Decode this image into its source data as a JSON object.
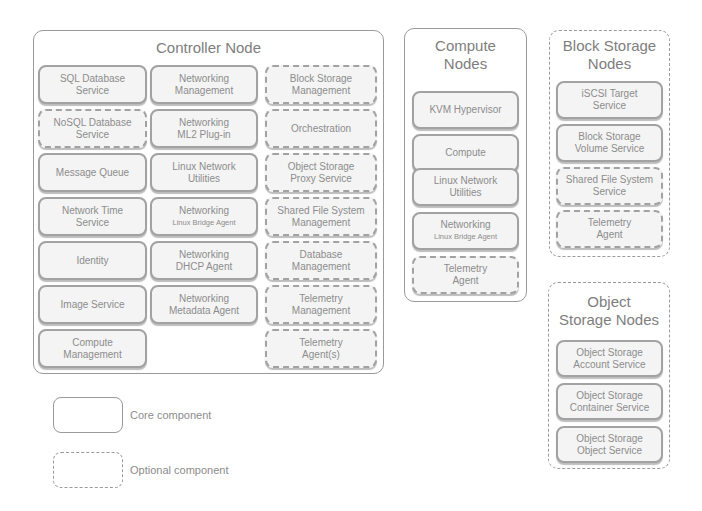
{
  "diagram": {
    "controller": {
      "title": "Controller Node",
      "style": "core",
      "columns": [
        [
          {
            "l1": "SQL Database",
            "l2": "Service",
            "style": "core"
          },
          {
            "l1": "NoSQL Database",
            "l2": "Service",
            "style": "optional"
          },
          {
            "l1": "Message Queue",
            "l2": "",
            "style": "core"
          },
          {
            "l1": "Network Time",
            "l2": "Service",
            "style": "core"
          },
          {
            "l1": "Identity",
            "l2": "",
            "style": "core"
          },
          {
            "l1": "Image Service",
            "l2": "",
            "style": "core"
          },
          {
            "l1": "Compute",
            "l2": "Management",
            "style": "core"
          }
        ],
        [
          {
            "l1": "Networking",
            "l2": "Management",
            "style": "core"
          },
          {
            "l1": "Networking",
            "l2": "ML2 Plug-in",
            "style": "core"
          },
          {
            "l1": "Linux Network",
            "l2": "Utilities",
            "style": "core"
          },
          {
            "l1": "Networking",
            "l2": "Linux Bridge Agent",
            "style": "core",
            "small2": true
          },
          {
            "l1": "Networking",
            "l2": "DHCP Agent",
            "style": "core"
          },
          {
            "l1": "Networking",
            "l2": "Metadata Agent",
            "style": "core"
          }
        ],
        [
          {
            "l1": "Block Storage",
            "l2": "Management",
            "style": "optional"
          },
          {
            "l1": "Orchestration",
            "l2": "",
            "style": "optional"
          },
          {
            "l1": "Object Storage",
            "l2": "Proxy Service",
            "style": "optional"
          },
          {
            "l1": "Shared File System",
            "l2": "Management",
            "style": "optional"
          },
          {
            "l1": "Database",
            "l2": "Management",
            "style": "optional"
          },
          {
            "l1": "Telemetry",
            "l2": "Management",
            "style": "optional"
          },
          {
            "l1": "Telemetry",
            "l2": "Agent(s)",
            "style": "optional"
          }
        ]
      ]
    },
    "compute": {
      "title_l1": "Compute",
      "title_l2": "Nodes",
      "style": "core",
      "items": [
        {
          "l1": "KVM Hypervisor",
          "l2": "",
          "style": "core"
        },
        {
          "l1": "Compute",
          "l2": "",
          "style": "core"
        },
        {
          "l1": "Linux Network",
          "l2": "Utilities",
          "style": "core"
        },
        {
          "l1": "Networking",
          "l2": "Linux Bridge Agent",
          "style": "core",
          "small2": true
        },
        {
          "l1": "Telemetry",
          "l2": "Agent",
          "style": "optional"
        }
      ]
    },
    "block_storage": {
      "title_l1": "Block Storage",
      "title_l2": "Nodes",
      "style": "optional",
      "items": [
        {
          "l1": "iSCSI Target",
          "l2": "Service",
          "style": "core"
        },
        {
          "l1": "Block Storage",
          "l2": "Volume Service",
          "style": "core"
        },
        {
          "l1": "Shared File System",
          "l2": "Service",
          "style": "optional"
        },
        {
          "l1": "Telemetry",
          "l2": "Agent",
          "style": "optional"
        }
      ]
    },
    "object_storage": {
      "title_l1": "Object",
      "title_l2": "Storage Nodes",
      "style": "optional",
      "items": [
        {
          "l1": "Object Storage",
          "l2": "Account Service",
          "style": "core"
        },
        {
          "l1": "Object Storage",
          "l2": "Container Service",
          "style": "core"
        },
        {
          "l1": "Object Storage",
          "l2": "Object Service",
          "style": "core"
        }
      ]
    },
    "legend": {
      "core_label": "Core component",
      "optional_label": "Optional component"
    }
  }
}
